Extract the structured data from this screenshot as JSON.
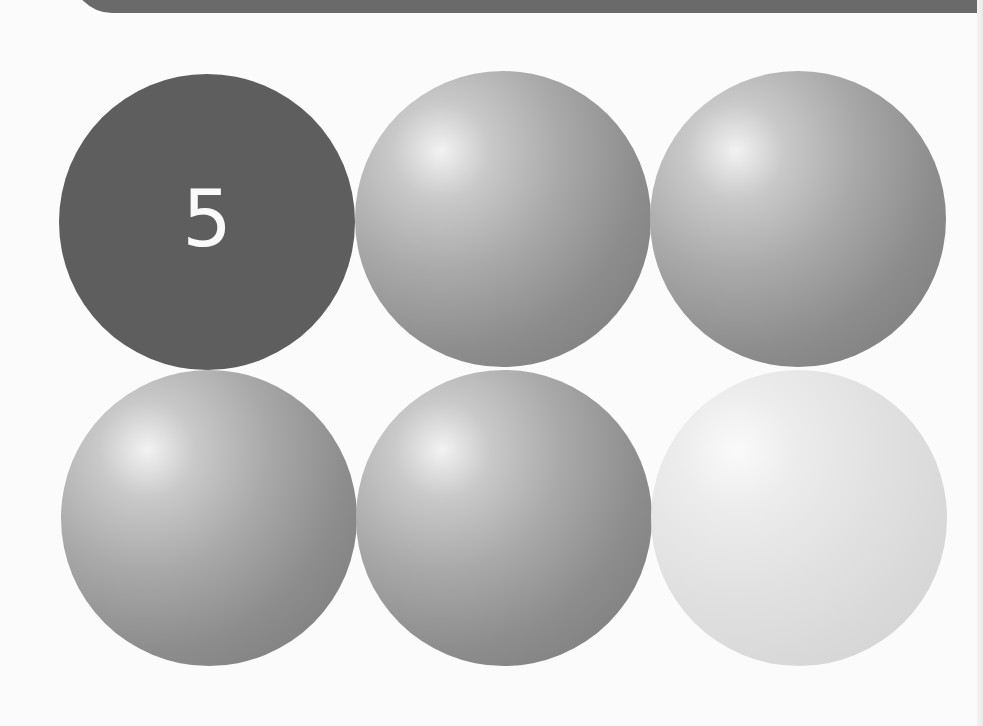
{
  "header_banner": {
    "color": "#6a6a6a"
  },
  "grid": {
    "rows": 2,
    "columns": 3,
    "balls": [
      {
        "position": "row1-col1",
        "style": "flat-dark",
        "color": "#5e5e5e",
        "label": "5"
      },
      {
        "position": "row1-col2",
        "style": "shaded-gray",
        "color": "#a9a9a9",
        "label": ""
      },
      {
        "position": "row1-col3",
        "style": "shaded-gray",
        "color": "#a9a9a9",
        "label": ""
      },
      {
        "position": "row2-col1",
        "style": "shaded-gray",
        "color": "#a9a9a9",
        "label": ""
      },
      {
        "position": "row2-col2",
        "style": "shaded-gray",
        "color": "#a9a9a9",
        "label": ""
      },
      {
        "position": "row2-col3",
        "style": "shaded-light",
        "color": "#e0e0e0",
        "label": ""
      }
    ]
  }
}
